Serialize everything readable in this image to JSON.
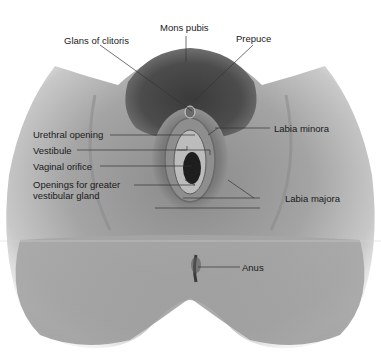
{
  "diagram": {
    "type": "anatomical-illustration",
    "labels": [
      {
        "id": "mons-pubis",
        "text": "Mons pubis"
      },
      {
        "id": "glans-of-clitoris",
        "text": "Glans of clitoris"
      },
      {
        "id": "prepuce",
        "text": "Prepuce"
      },
      {
        "id": "urethral-opening",
        "text": "Urethral opening"
      },
      {
        "id": "labia-minora",
        "text": "Labia minora"
      },
      {
        "id": "vestibule",
        "text": "Vestibule"
      },
      {
        "id": "vaginal-orifice",
        "text": "Vaginal orifice"
      },
      {
        "id": "openings-greater-vestibular-gland-line1",
        "text": "Openings for greater"
      },
      {
        "id": "openings-greater-vestibular-gland-line2",
        "text": "vestibular gland"
      },
      {
        "id": "labia-majora",
        "text": "Labia majora"
      },
      {
        "id": "anus",
        "text": "Anus"
      }
    ]
  }
}
